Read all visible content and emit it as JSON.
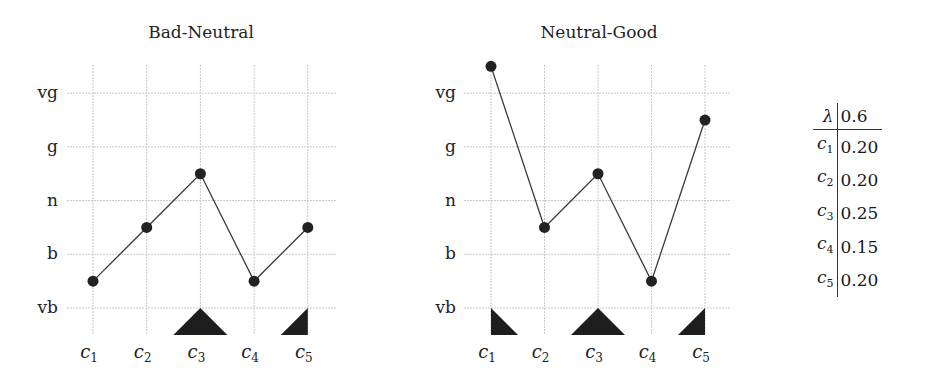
{
  "chart_data": [
    {
      "type": "line",
      "title": "Bad-Neutral",
      "categories": [
        "c1",
        "c2",
        "c3",
        "c4",
        "c5"
      ],
      "y_levels": [
        "vb",
        "b",
        "n",
        "g",
        "vg"
      ],
      "y_level_values": {
        "vb": 1,
        "b": 2,
        "n": 3,
        "g": 4,
        "vg": 5
      },
      "values": [
        1.5,
        2.5,
        3.5,
        1.5,
        2.5
      ],
      "grid": true,
      "markers": [
        {
          "category": "c3",
          "shape": "full-triangle"
        },
        {
          "category": "c5",
          "shape": "left-half-triangle"
        }
      ]
    },
    {
      "type": "line",
      "title": "Neutral-Good",
      "categories": [
        "c1",
        "c2",
        "c3",
        "c4",
        "c5"
      ],
      "y_levels": [
        "vb",
        "b",
        "n",
        "g",
        "vg"
      ],
      "y_level_values": {
        "vb": 1,
        "b": 2,
        "n": 3,
        "g": 4,
        "vg": 5
      },
      "values": [
        5.5,
        2.5,
        3.5,
        1.5,
        4.5
      ],
      "grid": true,
      "markers": [
        {
          "category": "c1",
          "shape": "right-half-triangle"
        },
        {
          "category": "c3",
          "shape": "full-triangle"
        },
        {
          "category": "c5",
          "shape": "left-half-triangle"
        }
      ]
    },
    {
      "type": "table",
      "header": {
        "key": "λ",
        "value": "0.6"
      },
      "rows": [
        {
          "key": "c",
          "sub": "1",
          "value": "0.20"
        },
        {
          "key": "c",
          "sub": "2",
          "value": "0.20"
        },
        {
          "key": "c",
          "sub": "3",
          "value": "0.25"
        },
        {
          "key": "c",
          "sub": "4",
          "value": "0.15"
        },
        {
          "key": "c",
          "sub": "5",
          "value": "0.20"
        }
      ]
    }
  ],
  "labels": {
    "left_title": "Bad-Neutral",
    "right_title": "Neutral-Good",
    "y": [
      "vg",
      "g",
      "n",
      "b",
      "vb"
    ],
    "x": [
      {
        "c": "c",
        "s": "1"
      },
      {
        "c": "c",
        "s": "2"
      },
      {
        "c": "c",
        "s": "3"
      },
      {
        "c": "c",
        "s": "4"
      },
      {
        "c": "c",
        "s": "5"
      }
    ]
  }
}
